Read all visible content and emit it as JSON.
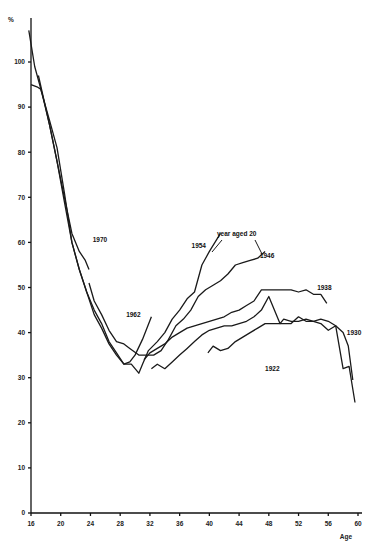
{
  "chart_data": {
    "type": "line",
    "title": "",
    "xlabel": "Age",
    "ylabel": "%",
    "xlim": [
      16,
      60
    ],
    "ylim": [
      0,
      108
    ],
    "x_ticks": [
      16,
      20,
      24,
      28,
      32,
      36,
      40,
      44,
      48,
      52,
      56,
      60
    ],
    "y_ticks": [
      0,
      10,
      20,
      30,
      40,
      50,
      60,
      70,
      80,
      90,
      100
    ],
    "grid": false,
    "legend": "direct labels on lines",
    "annotation": "year aged 20",
    "series": [
      {
        "name": "1970",
        "label_pos": [
          24.3,
          60
        ],
        "x": [
          15.7,
          16.5,
          17.5,
          18.5,
          19.5,
          20.5,
          21.5,
          22.5,
          23.3,
          23.8
        ],
        "y": [
          107,
          99,
          93,
          86,
          78,
          70,
          62,
          58,
          56,
          54
        ]
      },
      {
        "name": "1962",
        "label_pos": [
          28.8,
          43.5
        ],
        "x": [
          16,
          16.8,
          17.3,
          18.5,
          19.5,
          20.5,
          21.5,
          22.5,
          23.5,
          24.5,
          25.5,
          26.5,
          27.5,
          28.5,
          29.3,
          30.0,
          31.0,
          32.2
        ],
        "y": [
          95,
          94.5,
          94,
          87,
          81,
          71,
          60,
          54,
          49,
          44,
          41,
          37.5,
          35,
          33,
          33.5,
          35,
          38.5,
          43.5
        ]
      },
      {
        "name": "1954",
        "label_pos": [
          37.6,
          58.8
        ],
        "x": [
          17,
          18.5,
          19.5,
          20.5,
          21.5,
          22.5,
          23.5,
          24.5,
          25.5,
          26.5,
          27.5,
          28.5,
          29.5,
          30.5,
          31.0,
          31.8,
          33,
          34,
          35,
          36,
          37,
          38,
          39,
          40,
          41.5
        ],
        "y": [
          97,
          86,
          78,
          69,
          60,
          54,
          49,
          45,
          42,
          38,
          35.5,
          33,
          33,
          31,
          33,
          36,
          38,
          40,
          43,
          45,
          47.5,
          49,
          55,
          58,
          62
        ]
      },
      {
        "name": "1946",
        "label_pos": [
          46.8,
          56.5
        ],
        "x": [
          23.8,
          24.5,
          25.5,
          26.5,
          27.5,
          28.5,
          29.3,
          30.5,
          31.5,
          32.5,
          33.5,
          34.5,
          35.5,
          36.5,
          37.5,
          38.5,
          39.5,
          40.5,
          41.5,
          42.5,
          43.5,
          44.5,
          45.5,
          46.5,
          47.5
        ],
        "y": [
          51,
          47,
          44,
          40.5,
          38,
          37.5,
          36.5,
          35,
          35,
          35,
          36,
          38.5,
          41.5,
          43,
          45,
          48,
          49.5,
          50.5,
          51.5,
          53,
          55,
          55.5,
          56,
          56.5,
          58
        ]
      },
      {
        "name": "1938",
        "label_pos": [
          54.5,
          49.5
        ],
        "x": [
          31.2,
          32.0,
          33.0,
          34.0,
          35.0,
          36.0,
          37.0,
          38.0,
          39.0,
          40.0,
          41.0,
          42.0,
          43.0,
          44.0,
          45.0,
          46.0,
          47.0,
          48.0,
          50.0,
          51.0,
          52.0,
          53.0,
          54.0,
          55.0,
          55.8
        ],
        "y": [
          34,
          35.5,
          36.5,
          37.5,
          39,
          40,
          41,
          41.5,
          42,
          42.5,
          43,
          43.5,
          44.5,
          45,
          46,
          47,
          49.5,
          49.5,
          49.5,
          49.5,
          49,
          49.5,
          48.5,
          48.5,
          46.5
        ]
      },
      {
        "name": "1930",
        "label_pos": [
          58.5,
          39.5
        ],
        "x": [
          32.2,
          33.0,
          34.0,
          35.0,
          36.0,
          37.0,
          38.0,
          39.0,
          40.0,
          41.0,
          42.0,
          43.0,
          44.0,
          45.0,
          46.0,
          47.0,
          48.0,
          49.5,
          50.0,
          51.0,
          52.0,
          53.0,
          54.0,
          55.0,
          56.0,
          57.0,
          58.0,
          58.7,
          59.3
        ],
        "y": [
          32,
          33,
          32,
          33.5,
          35,
          36.5,
          38,
          39.5,
          40.5,
          41,
          41.5,
          41.5,
          42,
          42.5,
          43.5,
          45,
          48,
          42,
          43,
          42.5,
          42.5,
          43,
          42.5,
          42,
          40.5,
          41.5,
          40,
          37,
          29.5
        ]
      },
      {
        "name": "1922",
        "label_pos": [
          47.5,
          31.5
        ],
        "x": [
          39.8,
          40.5,
          41.5,
          42.5,
          43.5,
          44.5,
          45.5,
          46.5,
          47.5,
          48.0,
          49.0,
          50.0,
          51.0,
          52.0,
          53.0,
          54.0,
          55.0,
          56.0,
          57.0,
          58.0,
          58.8,
          59.6
        ],
        "y": [
          35.5,
          37,
          36,
          36.5,
          38,
          39,
          40,
          41,
          42,
          42,
          42,
          42,
          42,
          43.5,
          42.5,
          42.5,
          43,
          42.5,
          41.5,
          32,
          32.5,
          24.5
        ]
      }
    ]
  },
  "axis": {
    "y_unit_label": "%",
    "x_title": "Age"
  }
}
